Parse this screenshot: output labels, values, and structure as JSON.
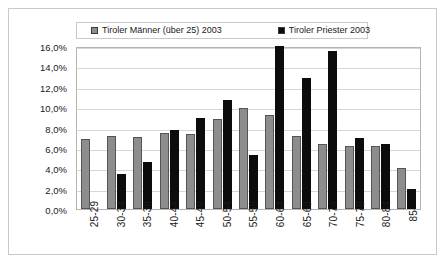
{
  "chart_data": {
    "type": "bar",
    "title": "",
    "subtitle": "",
    "xlabel": "",
    "ylabel": "",
    "grid": true,
    "legend_position": "top",
    "ylim": [
      0,
      16
    ],
    "ytick_labels": [
      "16,0%",
      "14,0%",
      "12,0%",
      "10,0%",
      "8,0%",
      "6,0%",
      "4,0%",
      "2,0%",
      "0,0%"
    ],
    "ytick_values": [
      16,
      14,
      12,
      10,
      8,
      6,
      4,
      2,
      0
    ],
    "categories": [
      "25-29",
      "30-34",
      "35-39",
      "40-44",
      "45-49",
      "50-54",
      "55-59",
      "60-64",
      "65-69",
      "70-74",
      "75-79",
      "80-84",
      "85-"
    ],
    "series": [
      {
        "name": "Tiroler Männer (über 25) 2003",
        "color": "#8d8d8d",
        "values": [
          6.9,
          7.2,
          7.1,
          7.5,
          7.4,
          8.8,
          9.9,
          9.2,
          7.2,
          6.4,
          6.2,
          6.2,
          4.0
        ]
      },
      {
        "name": "Tiroler Priester 2003",
        "color": "#0c0c0c",
        "values": [
          0,
          3.4,
          4.6,
          7.8,
          8.9,
          10.7,
          5.3,
          16.0,
          12.9,
          15.5,
          7.0,
          6.4,
          2.0
        ]
      }
    ]
  },
  "legend": {
    "entries": [
      {
        "label": "Tiroler Männer (über 25) 2003",
        "swatch": "gray-square-icon"
      },
      {
        "label": "Tiroler Priester 2003",
        "swatch": "black-square-icon"
      }
    ]
  }
}
